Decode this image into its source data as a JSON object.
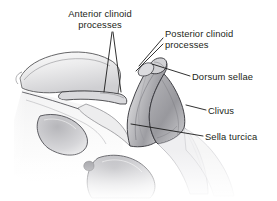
{
  "figure": {
    "background_color": "#ffffff",
    "text_color": "#231f20",
    "line_color": "#1a1a1a",
    "width": 277,
    "height": 201
  },
  "labels": {
    "anterior_clinoid": {
      "line1": "Anterior clinoid",
      "line2": "processes",
      "align": "center"
    },
    "posterior_clinoid": {
      "line1": "Posterior clinoid",
      "line2": "processes",
      "align": "left"
    },
    "dorsum_sellae": {
      "text": "Dorsum sellae"
    },
    "clivus": {
      "text": "Clivus"
    },
    "sella_turcica": {
      "text": "Sella turcica"
    }
  },
  "leader_lines": [
    {
      "name": "anterior-clinoid-leader-left",
      "points": "112,32 104,92"
    },
    {
      "name": "anterior-clinoid-leader-right",
      "points": "113,32 121,92"
    },
    {
      "name": "posterior-clinoid-leader-upper",
      "points": "163,38 139,66"
    },
    {
      "name": "posterior-clinoid-leader-lower",
      "points": "163,44 136,71"
    },
    {
      "name": "dorsum-sellae-leader",
      "points": "190,76 152,64"
    },
    {
      "name": "clivus-leader",
      "points": "206,110 186,105"
    },
    {
      "name": "sella-turcica-leader",
      "points": "203,136 131,124"
    }
  ],
  "anatomy_regions": [
    {
      "name": "left-lesser-wing",
      "shade": "#e9e9ea"
    },
    {
      "name": "anterior-clinoid-process",
      "shade": "#d6d6d8"
    },
    {
      "name": "sella-turcica-floor",
      "shade": "#efefef"
    },
    {
      "name": "dorsum-sellae",
      "shade": "#b9b9bc"
    },
    {
      "name": "posterior-clinoid-process",
      "shade": "#cfcfd2"
    },
    {
      "name": "clivus",
      "shade": "#a9a9ad"
    },
    {
      "name": "foramen-anterior",
      "shade": "#c9c9cc"
    },
    {
      "name": "foramen-posterior",
      "shade": "#bdbdc0"
    }
  ]
}
